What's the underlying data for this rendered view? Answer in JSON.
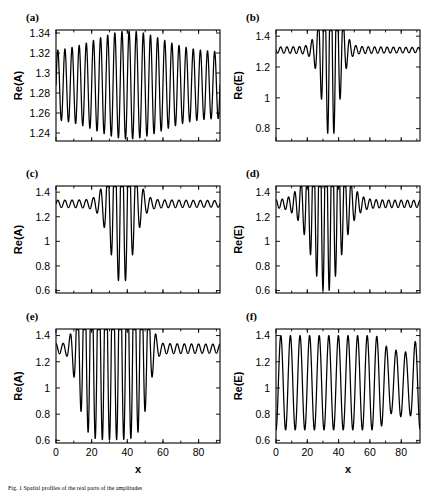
{
  "figure": {
    "caption": "Fig. 1 Spatial profiles of the real parts of the amplitudes",
    "xlabel": "x",
    "panels_count": 6
  },
  "chart_data": [
    {
      "id": "a",
      "type": "line",
      "panel_label": "(a)",
      "title": "",
      "xlabel": "",
      "ylabel": "Re(A)",
      "xlim": [
        0,
        92
      ],
      "ylim": [
        1.232,
        1.343
      ],
      "xticks": [
        0,
        20,
        40,
        60,
        80
      ],
      "yticks": [
        1.24,
        1.26,
        1.28,
        1.3,
        1.32,
        1.34
      ],
      "ytick_labels": [
        "1.24",
        "1.26",
        "1.28",
        "1.3",
        "1.32",
        "1.34"
      ],
      "xtick_labels": [
        "",
        "",
        "",
        "",
        ""
      ],
      "grid": false,
      "legend": null,
      "baseline": 1.288,
      "n_cycles": 23,
      "description": "dense uniform-period oscillation, amplitude modulated with maximum near center",
      "envelope": {
        "base": 0.033,
        "peak_extra": 0.021,
        "center": 41,
        "width": 26
      }
    },
    {
      "id": "b",
      "type": "line",
      "panel_label": "(b)",
      "title": "",
      "xlabel": "",
      "ylabel": "Re(E)",
      "xlim": [
        0,
        92
      ],
      "ylim": [
        0.72,
        1.44
      ],
      "xticks": [
        0,
        20,
        40,
        60,
        80
      ],
      "yticks": [
        0.8,
        1.0,
        1.2,
        1.4
      ],
      "ytick_labels": [
        "0.8",
        "1",
        "1.2",
        "1.4"
      ],
      "xtick_labels": [
        "",
        "",
        "",
        "",
        ""
      ],
      "grid": false,
      "legend": null,
      "baseline": 1.31,
      "n_cycles": 23,
      "description": "flat background with one very deep localized dip to 0.75 near x=35 and decaying ripples on both sides",
      "envelope": {
        "base": 0.012,
        "peak_extra": 0.55,
        "center": 35,
        "width": 7.5
      }
    },
    {
      "id": "c",
      "type": "line",
      "panel_label": "(c)",
      "title": "",
      "xlabel": "",
      "ylabel": "Re(A)",
      "xlim": [
        0,
        92
      ],
      "ylim": [
        0.58,
        1.45
      ],
      "xticks": [
        0,
        20,
        40,
        60,
        80
      ],
      "yticks": [
        0.6,
        0.8,
        1.0,
        1.2,
        1.4
      ],
      "ytick_labels": [
        "0.6",
        "0.8",
        "1",
        "1.2",
        "1.4"
      ],
      "xtick_labels": [
        "",
        "",
        "",
        "",
        ""
      ],
      "grid": false,
      "legend": null,
      "baseline": 1.305,
      "n_cycles": 23,
      "description": "three deep oscillations reaching 0.65 centered near x=37 with symmetric decaying ripples",
      "envelope": {
        "base": 0.022,
        "peak_extra": 0.62,
        "center": 37,
        "width": 8.5
      }
    },
    {
      "id": "d",
      "type": "line",
      "panel_label": "(d)",
      "title": "",
      "xlabel": "",
      "ylabel": "Re(E)",
      "xlim": [
        0,
        92
      ],
      "ylim": [
        0.58,
        1.45
      ],
      "xticks": [
        0,
        20,
        40,
        60,
        80
      ],
      "yticks": [
        0.6,
        0.8,
        1.0,
        1.2,
        1.4
      ],
      "ytick_labels": [
        "0.6",
        "0.8",
        "1",
        "1.2",
        "1.4"
      ],
      "xtick_labels": [
        "",
        "",
        "",
        "",
        ""
      ],
      "grid": false,
      "legend": null,
      "baseline": 1.305,
      "n_cycles": 23,
      "description": "five to six deep oscillations reaching 0.6 centered near x=32 with ripples decaying to the right",
      "envelope": {
        "base": 0.024,
        "peak_extra": 0.68,
        "center": 32,
        "width": 13
      }
    },
    {
      "id": "e",
      "type": "line",
      "panel_label": "(e)",
      "title": "",
      "xlabel": "x",
      "ylabel": "Re(A)",
      "xlim": [
        0,
        92
      ],
      "ylim": [
        0.58,
        1.45
      ],
      "xticks": [
        0,
        20,
        40,
        60,
        80
      ],
      "yticks": [
        0.6,
        0.8,
        1.0,
        1.2,
        1.4
      ],
      "ytick_labels": [
        "0.6",
        "0.8",
        "1",
        "1.2",
        "1.4"
      ],
      "xtick_labels": [
        "0",
        "20",
        "40",
        "60",
        "80"
      ],
      "grid": false,
      "legend": null,
      "baseline": 1.3,
      "n_cycles": 23,
      "description": "eight deep oscillations between x=13 and x=52 reaching 0.63, small ripples elsewhere",
      "envelope": {
        "base": 0.03,
        "peak_extra": 0.65,
        "center": 32,
        "width": 21
      }
    },
    {
      "id": "f",
      "type": "line",
      "panel_label": "(f)",
      "title": "",
      "xlabel": "x",
      "ylabel": "Re(E)",
      "xlim": [
        0,
        92
      ],
      "ylim": [
        0.58,
        1.45
      ],
      "xticks": [
        0,
        20,
        40,
        60,
        80
      ],
      "yticks": [
        0.6,
        0.8,
        1.0,
        1.2,
        1.4
      ],
      "ytick_labels": [
        "0.6",
        "0.8",
        "1",
        "1.2",
        "1.4"
      ],
      "xtick_labels": [
        "0",
        "20",
        "40",
        "60",
        "80"
      ],
      "grid": false,
      "legend": null,
      "baseline": 1.04,
      "n_cycles": 15,
      "description": "large amplitude oscillation across entire domain between 0.65 and 1.40, two shallower peaks near x=74 and x=84",
      "envelope": {
        "base": 0.36,
        "peak_extra": 0.0,
        "center": 46,
        "width": 80
      }
    }
  ]
}
